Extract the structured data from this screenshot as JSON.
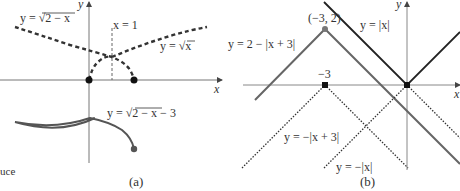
{
  "panel_a": {
    "caption": "(a)",
    "x_axis_label": "x",
    "y_axis_label": "y",
    "labels": {
      "sqrt_2_minus_x": "y = √2 − x",
      "sqrt_x": "y = √x",
      "x_eq_1": "x = 1",
      "shifted": "y = √2 − x − 3"
    },
    "curves": [
      {
        "name": "y = sqrt(x)",
        "style": "dashed"
      },
      {
        "name": "y = sqrt(2 - x)",
        "style": "dashed"
      },
      {
        "name": "x = 1",
        "style": "thin-dashed"
      },
      {
        "name": "y = sqrt(2 - x) - 3",
        "style": "solid"
      }
    ],
    "points": [
      [
        0,
        0
      ],
      [
        2,
        0
      ],
      [
        2,
        -3
      ]
    ]
  },
  "panel_b": {
    "caption": "(b)",
    "x_axis_label": "x",
    "y_axis_label": "y",
    "labels": {
      "abs_x": "y = |x|",
      "two_minus": "y = 2 − |x + 3|",
      "neg_shift": "y = −|x + 3|",
      "neg_abs": "y = −|x|",
      "vertex": "(−3, 2)",
      "minus3": "−3"
    },
    "curves": [
      {
        "name": "y = |x|",
        "style": "solid"
      },
      {
        "name": "y = 2 - |x + 3|",
        "style": "solid-gray"
      },
      {
        "name": "y = -|x + 3|",
        "style": "dotted"
      },
      {
        "name": "y = -|x|",
        "style": "dotted"
      }
    ],
    "points": [
      [
        0,
        0
      ],
      [
        -3,
        0
      ],
      [
        -3,
        2
      ]
    ]
  },
  "margin_text": "uce"
}
